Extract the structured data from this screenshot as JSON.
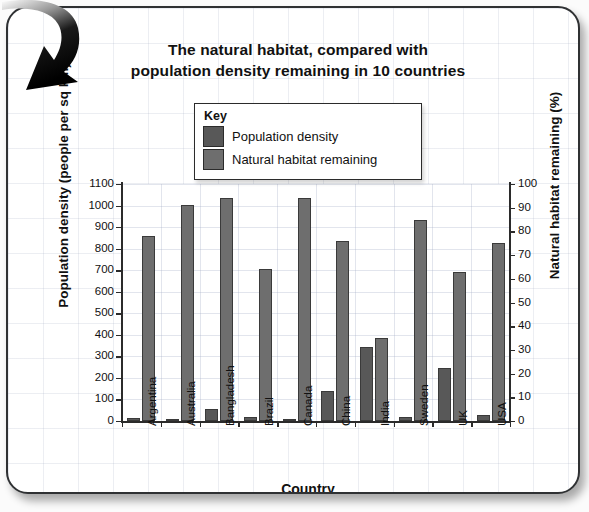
{
  "chart_data": {
    "type": "bar",
    "title": "The natural habitat, compared with population density remaining in 10 countries",
    "title_line1": "The natural habitat, compared with",
    "title_line2": "population density remaining in 10 countries",
    "xlabel": "Country",
    "ylabel": "Population density (people per sq km)",
    "ylabel_right": "Natural habitat remaining (%)",
    "categories": [
      "Argentina",
      "Australia",
      "Bangladesh",
      "Brazil",
      "Canada",
      "China",
      "India",
      "Sweden",
      "UK",
      "USA"
    ],
    "series": [
      {
        "name": "Population density",
        "axis": "left",
        "color": "#585858",
        "values": [
          15,
          3,
          55,
          20,
          3,
          140,
          345,
          20,
          245,
          30
        ]
      },
      {
        "name": "Natural habitat remaining",
        "axis": "right",
        "color": "#6e6e6e",
        "values": [
          78,
          91,
          94,
          64,
          94,
          76,
          35,
          85,
          63,
          75
        ]
      }
    ],
    "left_axis": {
      "min": 0,
      "max": 1100,
      "step": 100,
      "ticks": [
        "0",
        "100",
        "200",
        "300",
        "400",
        "500",
        "600",
        "700",
        "800",
        "900",
        "1000",
        "1100"
      ]
    },
    "right_axis": {
      "min": 0,
      "max": 100,
      "step": 10,
      "ticks": [
        "0",
        "10",
        "20",
        "30",
        "40",
        "50",
        "60",
        "70",
        "80",
        "90",
        "100"
      ]
    },
    "grid": true,
    "legend_position": "top-center-inside"
  },
  "legend": {
    "title": "Key",
    "items": [
      {
        "label": "Population density",
        "color": "#585858"
      },
      {
        "label": "Natural habitat remaining",
        "color": "#6e6e6e"
      }
    ]
  },
  "decoration": {
    "arrow": "curved-arrow-down-left"
  }
}
